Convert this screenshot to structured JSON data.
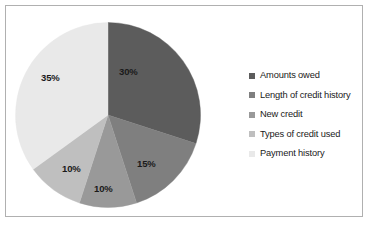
{
  "chart_data": {
    "type": "pie",
    "title": "",
    "categories": [
      "Amounts owed",
      "Length of credit history",
      "New credit",
      "Types of credit used",
      "Payment history"
    ],
    "values": [
      30,
      15,
      10,
      10,
      35
    ],
    "value_labels": [
      "30%",
      "15%",
      "10%",
      "10%",
      "35%"
    ],
    "colors": [
      "#5c5c5c",
      "#7f7f7f",
      "#999999",
      "#bfbfbf",
      "#e9e9e9"
    ],
    "legend_position": "right",
    "start_angle_deg": 0,
    "direction": "clockwise",
    "grid": false,
    "xlabel": "",
    "ylabel": ""
  },
  "legend": {
    "items": [
      {
        "label": "Amounts owed",
        "color": "#5c5c5c"
      },
      {
        "label": "Length of credit history",
        "color": "#7f7f7f"
      },
      {
        "label": "New credit",
        "color": "#999999"
      },
      {
        "label": "Types of credit used",
        "color": "#bfbfbf"
      },
      {
        "label": "Payment history",
        "color": "#e9e9e9"
      }
    ]
  },
  "slice_labels": [
    {
      "text": "30%",
      "left": 119,
      "top": 66
    },
    {
      "text": "15%",
      "left": 137,
      "top": 158
    },
    {
      "text": "10%",
      "left": 94,
      "top": 183
    },
    {
      "text": "10%",
      "left": 62,
      "top": 163
    },
    {
      "text": "35%",
      "left": 41,
      "top": 72
    }
  ],
  "frame": {
    "border_color": "#b0b0b0",
    "background": "#ffffff"
  }
}
